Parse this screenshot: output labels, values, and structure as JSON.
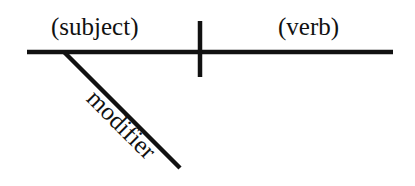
{
  "diagram": {
    "type": "sentence-diagram",
    "subject_label": "(subject)",
    "verb_label": "(verb)",
    "modifier_label": "modifier",
    "line_color": "#111111",
    "background_color": "#ffffff"
  }
}
